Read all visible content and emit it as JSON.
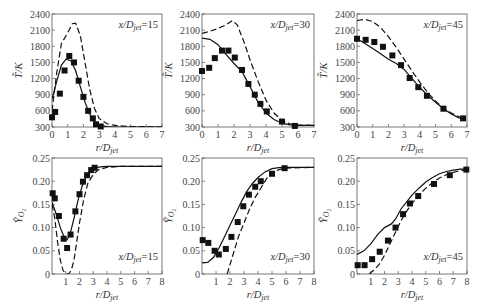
{
  "figure": {
    "xlabel": "r/D_jet",
    "ylabel_T": "T̃/K",
    "ylabel_Y": "Ỹ_O2"
  },
  "chart_data": [
    {
      "type": "line",
      "panel": "top-left",
      "annotation": "x/D_jet=15",
      "xlabel": "r/D_jet",
      "ylabel": "T/K",
      "xlim": [
        0,
        7
      ],
      "ylim": [
        300,
        2400
      ],
      "xticks": [
        0,
        1,
        2,
        3,
        4,
        5,
        6,
        7
      ],
      "yticks": [
        300,
        600,
        900,
        1200,
        1500,
        1800,
        2100,
        2400
      ],
      "series": [
        {
          "name": "solid",
          "style": "solid",
          "x": [
            0,
            0.3,
            0.6,
            0.9,
            1.2,
            1.5,
            1.8,
            2.1,
            2.4,
            2.7,
            3.0,
            3.5,
            4,
            5,
            6,
            7
          ],
          "y": [
            820,
            1150,
            1450,
            1560,
            1530,
            1350,
            1050,
            760,
            540,
            400,
            330,
            305,
            300,
            300,
            300,
            300
          ]
        },
        {
          "name": "dashed",
          "style": "dashed",
          "x": [
            0,
            0.3,
            0.6,
            1.0,
            1.3,
            1.5,
            1.8,
            2.1,
            2.4,
            2.7,
            3.0,
            3.5,
            4,
            5,
            6,
            7
          ],
          "y": [
            600,
            1300,
            1850,
            2050,
            2220,
            2230,
            2000,
            1500,
            1000,
            650,
            460,
            360,
            330,
            310,
            305,
            300
          ]
        },
        {
          "name": "experiment",
          "style": "markers",
          "x": [
            0,
            0.2,
            0.5,
            0.8,
            1.1,
            1.4,
            1.7,
            2.0,
            2.3,
            2.6,
            2.8,
            3.1
          ],
          "y": [
            480,
            580,
            920,
            1350,
            1620,
            1500,
            1160,
            860,
            600,
            460,
            350,
            310
          ]
        }
      ]
    },
    {
      "type": "line",
      "panel": "top-middle",
      "annotation": "x/D_jet=30",
      "xlabel": "r/D_jet",
      "ylabel": "T/K",
      "xlim": [
        0,
        7
      ],
      "ylim": [
        300,
        2400
      ],
      "xticks": [
        0,
        1,
        2,
        3,
        4,
        5,
        6,
        7
      ],
      "yticks": [
        300,
        600,
        900,
        1200,
        1500,
        1800,
        2100,
        2400
      ],
      "series": [
        {
          "name": "solid",
          "style": "solid",
          "x": [
            0,
            0.5,
            1.0,
            1.5,
            2.0,
            2.5,
            3.0,
            3.5,
            4.0,
            4.5,
            5.0,
            5.5,
            6,
            7
          ],
          "y": [
            1950,
            1930,
            1830,
            1650,
            1480,
            1330,
            1050,
            760,
            560,
            440,
            370,
            340,
            330,
            330
          ]
        },
        {
          "name": "dashed",
          "style": "dashed",
          "x": [
            0,
            0.5,
            1.0,
            1.5,
            1.9,
            2.2,
            2.6,
            3.0,
            3.5,
            4.0,
            4.5,
            5.0,
            5.5,
            6,
            7
          ],
          "y": [
            2040,
            2080,
            2130,
            2200,
            2280,
            2200,
            1900,
            1550,
            1150,
            800,
            560,
            420,
            360,
            340,
            330
          ]
        },
        {
          "name": "experiment",
          "style": "markers",
          "x": [
            0,
            0.45,
            0.8,
            1.25,
            1.65,
            2.05,
            2.5,
            2.9,
            3.3,
            3.65,
            4.05,
            5.0,
            5.8
          ],
          "y": [
            1340,
            1400,
            1580,
            1720,
            1720,
            1590,
            1360,
            1100,
            900,
            730,
            590,
            400,
            320
          ]
        }
      ]
    },
    {
      "type": "line",
      "panel": "top-right",
      "annotation": "x/D_jet=45",
      "xlabel": "r/D_jet",
      "ylabel": "T/K",
      "xlim": [
        0,
        7
      ],
      "ylim": [
        300,
        2400
      ],
      "xticks": [
        0,
        1,
        2,
        3,
        4,
        5,
        6,
        7
      ],
      "yticks": [
        300,
        600,
        900,
        1200,
        1500,
        1800,
        2100,
        2400
      ],
      "series": [
        {
          "name": "solid",
          "style": "solid",
          "x": [
            0,
            0.5,
            1.0,
            1.5,
            2.0,
            2.5,
            3.0,
            3.5,
            4.0,
            4.5,
            5.0,
            5.5,
            6.0,
            6.5,
            6.8
          ],
          "y": [
            1940,
            1850,
            1760,
            1660,
            1560,
            1480,
            1370,
            1200,
            1030,
            890,
            760,
            640,
            540,
            470,
            450
          ]
        },
        {
          "name": "dashed",
          "style": "dashed",
          "x": [
            0,
            0.5,
            1.0,
            1.5,
            2.0,
            2.5,
            3.0,
            3.5,
            4.0,
            4.5,
            5.0,
            5.5,
            6.0,
            6.5,
            6.8
          ],
          "y": [
            2280,
            2300,
            2260,
            2150,
            1980,
            1780,
            1560,
            1340,
            1130,
            940,
            780,
            650,
            560,
            490,
            460
          ]
        },
        {
          "name": "experiment",
          "style": "markers",
          "x": [
            0,
            0.55,
            1.1,
            1.65,
            2.25,
            2.8,
            3.35,
            3.9,
            4.45,
            5.5,
            6.75
          ],
          "y": [
            1940,
            1920,
            1880,
            1790,
            1630,
            1450,
            1210,
            1040,
            880,
            640,
            460
          ]
        }
      ]
    },
    {
      "type": "line",
      "panel": "bottom-left",
      "annotation": "x/D_jet=15",
      "xlabel": "r/D_jet",
      "ylabel": "Y_O2",
      "xlim": [
        0,
        8
      ],
      "ylim": [
        0,
        0.25
      ],
      "xticks": [
        1,
        2,
        3,
        4,
        5,
        6,
        7,
        8
      ],
      "yticks": [
        0,
        0.05,
        0.1,
        0.15,
        0.2,
        0.25
      ],
      "series": [
        {
          "name": "solid",
          "style": "solid",
          "x": [
            0,
            0.3,
            0.6,
            0.9,
            1.1,
            1.3,
            1.6,
            1.9,
            2.2,
            2.5,
            2.8,
            3.1,
            3.5,
            4,
            5,
            6,
            7,
            8
          ],
          "y": [
            0.155,
            0.13,
            0.1,
            0.078,
            0.074,
            0.085,
            0.12,
            0.16,
            0.19,
            0.21,
            0.222,
            0.228,
            0.231,
            0.232,
            0.232,
            0.232,
            0.232,
            0.232
          ]
        },
        {
          "name": "dashed",
          "style": "dashed",
          "x": [
            0,
            0.2,
            0.4,
            0.6,
            0.8,
            1.0,
            1.2,
            1.4,
            1.6,
            1.8,
            2.0,
            2.3,
            2.6,
            3.0,
            3.4,
            4,
            5,
            6,
            7,
            8
          ],
          "y": [
            0.15,
            0.12,
            0.07,
            0.03,
            0.008,
            0.0,
            0.0,
            0.008,
            0.03,
            0.07,
            0.11,
            0.16,
            0.195,
            0.215,
            0.225,
            0.23,
            0.232,
            0.232,
            0.232,
            0.232
          ]
        },
        {
          "name": "experiment",
          "style": "markers",
          "x": [
            0.05,
            0.2,
            0.5,
            0.85,
            1.1,
            1.35,
            1.7,
            2.0,
            2.25,
            2.55,
            2.85,
            3.1
          ],
          "y": [
            0.174,
            0.163,
            0.125,
            0.076,
            0.056,
            0.085,
            0.135,
            0.172,
            0.199,
            0.213,
            0.224,
            0.229
          ]
        }
      ]
    },
    {
      "type": "line",
      "panel": "bottom-middle",
      "annotation": "x/D_jet=30",
      "xlabel": "r/D_jet",
      "ylabel": "Y_O2",
      "xlim": [
        0,
        8
      ],
      "ylim": [
        0,
        0.25
      ],
      "xticks": [
        1,
        2,
        3,
        4,
        5,
        6,
        7,
        8
      ],
      "yticks": [
        0,
        0.05,
        0.1,
        0.15,
        0.2,
        0.25
      ],
      "series": [
        {
          "name": "solid",
          "style": "solid",
          "x": [
            0,
            0.4,
            0.8,
            1.2,
            1.6,
            2.0,
            2.4,
            2.8,
            3.2,
            3.6,
            4.0,
            4.5,
            5.0,
            5.5,
            6,
            7,
            8
          ],
          "y": [
            0.024,
            0.025,
            0.035,
            0.055,
            0.08,
            0.105,
            0.13,
            0.155,
            0.178,
            0.195,
            0.208,
            0.22,
            0.227,
            0.229,
            0.23,
            0.23,
            0.23
          ]
        },
        {
          "name": "dashed",
          "style": "dashed",
          "x": [
            1.8,
            2.0,
            2.3,
            2.6,
            3.0,
            3.4,
            3.8,
            4.2,
            4.6,
            5.0,
            5.5,
            6,
            7,
            8
          ],
          "y": [
            0.0,
            0.02,
            0.05,
            0.08,
            0.11,
            0.14,
            0.165,
            0.185,
            0.205,
            0.218,
            0.225,
            0.228,
            0.229,
            0.23
          ]
        },
        {
          "name": "experiment",
          "style": "markers",
          "x": [
            0.05,
            0.45,
            0.9,
            1.2,
            1.7,
            2.1,
            2.55,
            2.95,
            3.35,
            3.8,
            4.2,
            5.0,
            5.9
          ],
          "y": [
            0.073,
            0.067,
            0.05,
            0.042,
            0.054,
            0.08,
            0.112,
            0.146,
            0.171,
            0.188,
            0.2,
            0.216,
            0.228
          ]
        }
      ]
    },
    {
      "type": "line",
      "panel": "bottom-right",
      "annotation": "x/D_jet=45",
      "xlabel": "r/D_jet",
      "ylabel": "Y_O2",
      "xlim": [
        0,
        8
      ],
      "ylim": [
        0,
        0.25
      ],
      "xticks": [
        1,
        2,
        3,
        4,
        5,
        6,
        7,
        8
      ],
      "yticks": [
        0,
        0.05,
        0.1,
        0.15,
        0.2,
        0.25
      ],
      "series": [
        {
          "name": "solid",
          "style": "solid",
          "x": [
            0,
            0.5,
            1.0,
            1.5,
            2.0,
            2.5,
            2.8,
            3.2,
            3.6,
            4.0,
            4.5,
            5.0,
            5.5,
            6.0,
            6.5,
            7,
            7.5,
            8
          ],
          "y": [
            0.042,
            0.05,
            0.065,
            0.085,
            0.1,
            0.108,
            0.118,
            0.14,
            0.155,
            0.17,
            0.185,
            0.198,
            0.208,
            0.216,
            0.221,
            0.224,
            0.226,
            0.226
          ]
        },
        {
          "name": "dashed",
          "style": "dashed",
          "x": [
            0.9,
            1.2,
            1.6,
            2.0,
            2.4,
            2.8,
            3.2,
            3.6,
            4.0,
            4.5,
            5.0,
            5.5,
            6.0,
            6.5,
            7,
            7.5,
            8
          ],
          "y": [
            0.0,
            0.008,
            0.02,
            0.04,
            0.065,
            0.09,
            0.115,
            0.135,
            0.152,
            0.17,
            0.185,
            0.197,
            0.207,
            0.214,
            0.219,
            0.223,
            0.225
          ]
        },
        {
          "name": "experiment",
          "style": "markers",
          "x": [
            0.05,
            0.55,
            1.1,
            1.65,
            2.25,
            2.8,
            3.35,
            3.85,
            4.45,
            5.6,
            6.75,
            7.95
          ],
          "y": [
            0.019,
            0.019,
            0.032,
            0.048,
            0.072,
            0.1,
            0.129,
            0.152,
            0.168,
            0.194,
            0.213,
            0.225
          ]
        }
      ]
    }
  ]
}
